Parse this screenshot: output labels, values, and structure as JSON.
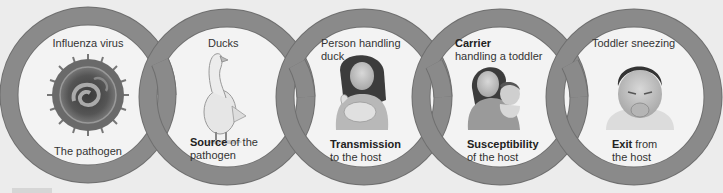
{
  "colors": {
    "ring": "#8a8a8a",
    "ring_edge": "#6f6f6f",
    "background": "#ececec",
    "inner": "#f3f3f3",
    "text": "#333333"
  },
  "links": [
    {
      "id": "pathogen",
      "top_label": "Influenza virus",
      "image": "influenza-virus-illustration",
      "bottom_bold": "",
      "bottom_text": "The pathogen"
    },
    {
      "id": "source",
      "top_label": "Ducks",
      "image": "duck-illustration",
      "bottom_bold": "Source",
      "bottom_text": " of the pathogen"
    },
    {
      "id": "transmission",
      "top_label": "Person handling duck",
      "image": "person-holding-duck-illustration",
      "bottom_bold": "Transmission",
      "bottom_text": "to the host"
    },
    {
      "id": "susceptibility",
      "top_bold": "Carrier",
      "top_label": "handling a toddler",
      "image": "carrier-holding-toddler-illustration",
      "bottom_bold": "Susceptibility",
      "bottom_text": "of the host"
    },
    {
      "id": "exit",
      "top_label": "Toddler sneezing",
      "image": "sneezing-toddler-illustration",
      "bottom_bold": "Exit",
      "bottom_text": " from the host"
    }
  ]
}
